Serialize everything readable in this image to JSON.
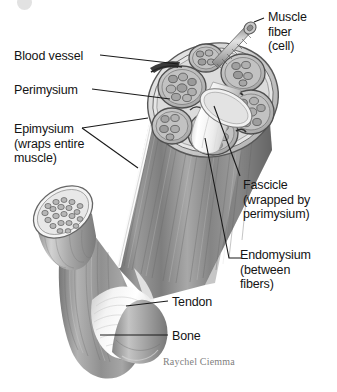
{
  "figure": {
    "credit": "Raychel Ciemma",
    "width": 337,
    "height": 392,
    "background": "#ffffff",
    "line_color": "#1a1a1a",
    "text_color": "#141414",
    "credit_color": "#808080"
  },
  "corner_mark": {
    "name": "page-corner-watermark",
    "color": "#e2e2e2"
  },
  "labels": [
    {
      "id": "muscle-fiber",
      "lines": [
        "Muscle",
        "fiber",
        "(cell)"
      ],
      "text": "Muscle fiber (cell)",
      "side": "right",
      "x": 268,
      "y": 10
    },
    {
      "id": "blood-vessel",
      "lines": [
        "Blood vessel"
      ],
      "text": "Blood vessel",
      "side": "left",
      "x": 14,
      "y": 49
    },
    {
      "id": "perimysium",
      "lines": [
        "Perimysium"
      ],
      "text": "Perimysium",
      "side": "left",
      "x": 14,
      "y": 83
    },
    {
      "id": "epimysium",
      "lines": [
        "Epimysium",
        "(wraps entire",
        "muscle)"
      ],
      "text": "Epimysium (wraps entire muscle)",
      "side": "left",
      "x": 14,
      "y": 122
    },
    {
      "id": "fascicle",
      "lines": [
        "Fascicle",
        "(wrapped by",
        "perimysium)"
      ],
      "text": "Fascicle (wrapped by perimysium)",
      "side": "right",
      "x": 243,
      "y": 178
    },
    {
      "id": "endomysium",
      "lines": [
        "Endomysium",
        "(between",
        "fibers)"
      ],
      "text": "Endomysium (between fibers)",
      "side": "right",
      "x": 240,
      "y": 248
    },
    {
      "id": "tendon",
      "lines": [
        "Tendon"
      ],
      "text": "Tendon",
      "side": "right",
      "x": 172,
      "y": 295
    },
    {
      "id": "bone",
      "lines": [
        "Bone"
      ],
      "text": "Bone",
      "side": "right",
      "x": 172,
      "y": 329
    }
  ],
  "anatomy_parts": [
    {
      "id": "muscle-belly",
      "name": "muscle-belly"
    },
    {
      "id": "cut-face",
      "name": "muscle-cut-cross-section"
    },
    {
      "id": "fascicle-bundle",
      "name": "fascicle-bundles"
    },
    {
      "id": "extracted-fiber",
      "name": "extracted-muscle-fiber"
    },
    {
      "id": "isolated-fascicle",
      "name": "isolated-cut-fascicle"
    },
    {
      "id": "tendon-shape",
      "name": "tendon"
    },
    {
      "id": "bone-shape",
      "name": "bone"
    }
  ]
}
